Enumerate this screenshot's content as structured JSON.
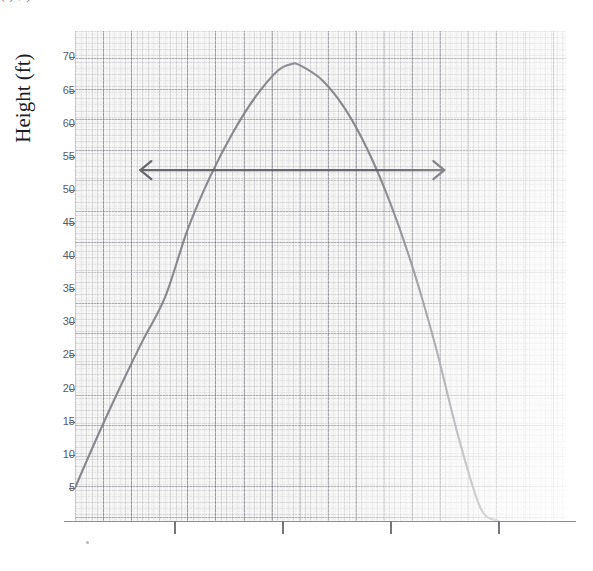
{
  "caption": {
    "clipped_text": "(  ) ,                                                                                                                    )"
  },
  "figure": {
    "y_axis_title": "Height (ft)"
  },
  "chart_data": {
    "type": "line",
    "title": "",
    "subtitle": "",
    "xlabel": "",
    "ylabel": "Height (ft)",
    "ylim": [
      0,
      74
    ],
    "xlim": [
      0,
      10.9
    ],
    "grid": true,
    "grid_style": "graph-paper, major and minor gridlines",
    "legend": "none",
    "background": "#f2f2f2",
    "y_ticks": [
      70,
      65,
      60,
      55,
      50,
      45,
      40,
      35,
      30,
      25,
      20,
      15,
      10,
      5
    ],
    "y_tick_labels": [
      "70",
      "65",
      "60",
      "55",
      "50",
      "45",
      "40",
      "35",
      "30",
      "25",
      "20",
      "15",
      "10",
      "5"
    ],
    "x_ticks": [
      2.2,
      4.6,
      7.0,
      9.4
    ],
    "x_tick_labels": [
      "",
      "",
      "",
      ""
    ],
    "series": [
      {
        "name": "Projectile height",
        "shape": "parabola (downward-opening)",
        "color": "#7a7a80",
        "vertex": [
          4.8,
          69
        ],
        "points_x": [
          0.0,
          0.5,
          1.0,
          1.5,
          2.0,
          2.5,
          3.0,
          3.5,
          4.0,
          4.5,
          4.8,
          5.0,
          5.5,
          6.0,
          6.5,
          7.0,
          7.5,
          8.0,
          8.5,
          9.0,
          9.4
        ],
        "points_y": [
          5.0,
          12.8,
          20.2,
          27.2,
          33.8,
          44.0,
          52.0,
          58.6,
          64.0,
          68.0,
          69.0,
          68.8,
          66.5,
          62.2,
          56.0,
          48.0,
          38.2,
          26.5,
          13.0,
          2.0,
          0.0
        ]
      }
    ],
    "annotations": [
      {
        "type": "double-headed-arrow",
        "orientation": "horizontal",
        "y_value": 53,
        "x_start": 1.45,
        "x_end": 8.2,
        "color": "#5a5a60",
        "label": ""
      }
    ]
  }
}
